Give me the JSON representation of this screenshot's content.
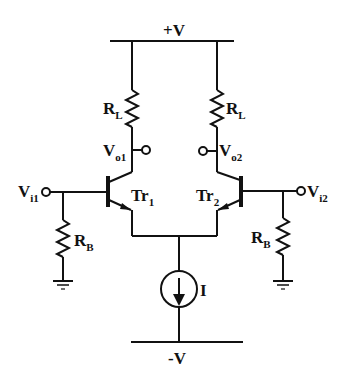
{
  "diagram": {
    "supply_positive": "+V",
    "supply_negative": "-V",
    "current_source": "I",
    "components": {
      "load_left": {
        "label": "R",
        "sub": "L"
      },
      "load_right": {
        "label": "R",
        "sub": "L"
      },
      "bias_left": {
        "label": "R",
        "sub": "B"
      },
      "bias_right": {
        "label": "R",
        "sub": "B"
      },
      "transistor_left": {
        "label": "Tr",
        "sub": "1"
      },
      "transistor_right": {
        "label": "Tr",
        "sub": "2"
      }
    },
    "terminals": {
      "out_left": {
        "label": "V",
        "sub": "o1"
      },
      "out_right": {
        "label": "V",
        "sub": "o2"
      },
      "in_left": {
        "label": "V",
        "sub": "i1"
      },
      "in_right": {
        "label": "V",
        "sub": "i2"
      }
    },
    "colors": {
      "wire": "#111111",
      "background": "#ffffff"
    }
  }
}
